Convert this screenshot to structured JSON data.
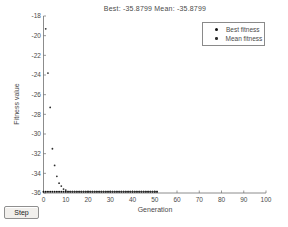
{
  "window": {
    "background": "#ffffff"
  },
  "controls": {
    "step_label": "Step"
  },
  "colors": {
    "axis": "#6e6e6e",
    "text": "#4a4a4a",
    "legend_border": "#8a8a8a",
    "button_bg": "#f1efec"
  },
  "chart_data": {
    "type": "scatter",
    "title": "Best: -35.8799 Mean: -35.8799",
    "xlabel": "Generation",
    "ylabel": "Fitness value",
    "xlim": [
      0,
      100
    ],
    "ylim": [
      -36,
      -18
    ],
    "xticks": [
      0,
      10,
      20,
      30,
      40,
      50,
      60,
      70,
      80,
      90,
      100
    ],
    "yticks": [
      -18,
      -20,
      -22,
      -24,
      -26,
      -28,
      -30,
      -32,
      -34,
      -36
    ],
    "grid": false,
    "best_value": -35.8799,
    "mean_value": -35.8799,
    "generations_run": 51,
    "legend": {
      "position": "top-right",
      "entries": [
        "Best fitness",
        "Mean fitness"
      ]
    },
    "series": [
      {
        "name": "Best fitness",
        "marker": "dot",
        "marker_radius": 1.0,
        "color": "#111111",
        "points": [
          [
            0,
            -35.88
          ],
          [
            1,
            -35.88
          ],
          [
            2,
            -35.88
          ],
          [
            3,
            -35.88
          ],
          [
            4,
            -35.88
          ],
          [
            5,
            -35.88
          ],
          [
            6,
            -35.88
          ],
          [
            7,
            -35.88
          ],
          [
            8,
            -35.88
          ],
          [
            9,
            -35.88
          ],
          [
            10,
            -35.88
          ],
          [
            11,
            -35.88
          ],
          [
            12,
            -35.88
          ],
          [
            13,
            -35.88
          ],
          [
            14,
            -35.88
          ],
          [
            15,
            -35.88
          ],
          [
            16,
            -35.88
          ],
          [
            17,
            -35.88
          ],
          [
            18,
            -35.88
          ],
          [
            19,
            -35.88
          ],
          [
            20,
            -35.88
          ],
          [
            21,
            -35.88
          ],
          [
            22,
            -35.88
          ],
          [
            23,
            -35.88
          ],
          [
            24,
            -35.88
          ],
          [
            25,
            -35.88
          ],
          [
            26,
            -35.88
          ],
          [
            27,
            -35.88
          ],
          [
            28,
            -35.88
          ],
          [
            29,
            -35.88
          ],
          [
            30,
            -35.88
          ],
          [
            31,
            -35.88
          ],
          [
            32,
            -35.88
          ],
          [
            33,
            -35.88
          ],
          [
            34,
            -35.88
          ],
          [
            35,
            -35.88
          ],
          [
            36,
            -35.88
          ],
          [
            37,
            -35.88
          ],
          [
            38,
            -35.88
          ],
          [
            39,
            -35.88
          ],
          [
            40,
            -35.88
          ],
          [
            41,
            -35.88
          ],
          [
            42,
            -35.88
          ],
          [
            43,
            -35.88
          ],
          [
            44,
            -35.88
          ],
          [
            45,
            -35.88
          ],
          [
            46,
            -35.88
          ],
          [
            47,
            -35.88
          ],
          [
            48,
            -35.88
          ],
          [
            49,
            -35.88
          ],
          [
            50,
            -35.88
          ],
          [
            51,
            -35.88
          ]
        ]
      },
      {
        "name": "Mean fitness",
        "marker": "dot",
        "marker_radius": 0.9,
        "color": "#2e2e2e",
        "points": [
          [
            1,
            -19.3
          ],
          [
            2,
            -23.8
          ],
          [
            3,
            -27.3
          ],
          [
            4,
            -31.5
          ],
          [
            5,
            -33.2
          ],
          [
            6,
            -34.3
          ],
          [
            7,
            -35.0
          ],
          [
            8,
            -35.3
          ],
          [
            9,
            -35.6
          ],
          [
            10,
            -35.7
          ],
          [
            11,
            -35.85
          ],
          [
            12,
            -35.85
          ],
          [
            13,
            -35.85
          ],
          [
            14,
            -35.85
          ],
          [
            15,
            -35.85
          ],
          [
            16,
            -35.85
          ],
          [
            17,
            -35.85
          ],
          [
            18,
            -35.85
          ],
          [
            19,
            -35.85
          ],
          [
            20,
            -35.85
          ],
          [
            21,
            -35.85
          ],
          [
            22,
            -35.85
          ],
          [
            23,
            -35.85
          ],
          [
            24,
            -35.85
          ],
          [
            25,
            -35.85
          ],
          [
            26,
            -35.85
          ],
          [
            27,
            -35.85
          ],
          [
            28,
            -35.85
          ],
          [
            29,
            -35.85
          ],
          [
            30,
            -35.85
          ],
          [
            31,
            -35.85
          ],
          [
            32,
            -35.85
          ],
          [
            33,
            -35.85
          ],
          [
            34,
            -35.85
          ],
          [
            35,
            -35.85
          ],
          [
            36,
            -35.85
          ],
          [
            37,
            -35.85
          ],
          [
            38,
            -35.85
          ],
          [
            39,
            -35.85
          ],
          [
            40,
            -35.85
          ],
          [
            41,
            -35.85
          ],
          [
            42,
            -35.85
          ],
          [
            43,
            -35.85
          ],
          [
            44,
            -35.85
          ],
          [
            45,
            -35.85
          ],
          [
            46,
            -35.85
          ],
          [
            47,
            -35.85
          ],
          [
            48,
            -35.85
          ],
          [
            49,
            -35.85
          ],
          [
            50,
            -35.85
          ],
          [
            51,
            -35.85
          ]
        ]
      }
    ]
  }
}
